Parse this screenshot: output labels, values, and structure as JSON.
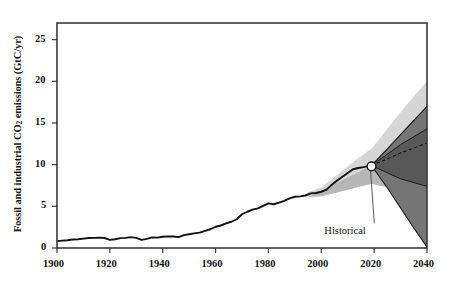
{
  "chart_data": {
    "type": "line",
    "title": "",
    "xlabel": "",
    "ylabel": "Fossil and industrial CO2 emissions (GtC/yr)",
    "ylabel_parts": {
      "pre": "Fossil and industrial CO",
      "sub": "2",
      "post": " emissions (GtC/yr)"
    },
    "xlim": [
      1900,
      2040
    ],
    "ylim": [
      0,
      27
    ],
    "grid": false,
    "legend": false,
    "xticks": [
      1900,
      1920,
      1940,
      1960,
      1980,
      2000,
      2020,
      2040
    ],
    "xtick_labels": [
      "1900",
      "1920",
      "1940",
      "1960",
      "1980",
      "2000",
      "2020",
      "2040"
    ],
    "yticks": [
      0,
      5,
      10,
      15,
      20,
      25
    ],
    "ytick_labels": [
      "0",
      "5",
      "10",
      "15",
      "20",
      "25"
    ],
    "annotations": [
      {
        "text": "Historical",
        "x": 2012.5,
        "y": 2.0,
        "points_to_x": 2019,
        "points_to_y": 9.8
      }
    ],
    "marker_point": {
      "x": 2019,
      "y": 9.8,
      "style": "white-filled-circle",
      "label": "Historical"
    },
    "colors": {
      "line": "#111111",
      "axis": "#3a3a3a",
      "band_light": "#c9c9c9",
      "band_mid": "#9a9a9a",
      "band_dark": "#6e6e6e",
      "band_darkest": "#4f4f4f",
      "marker_fill": "#ffffff",
      "marker_edge": "#111111",
      "text": "#141414"
    },
    "series": [
      {
        "name": "Historical emissions",
        "type": "line",
        "x": [
          1900,
          1902,
          1904,
          1906,
          1908,
          1910,
          1912,
          1914,
          1916,
          1918,
          1920,
          1922,
          1924,
          1926,
          1928,
          1930,
          1932,
          1934,
          1936,
          1938,
          1940,
          1942,
          1944,
          1946,
          1948,
          1950,
          1952,
          1954,
          1956,
          1958,
          1960,
          1962,
          1964,
          1966,
          1968,
          1970,
          1972,
          1974,
          1976,
          1978,
          1980,
          1982,
          1984,
          1986,
          1988,
          1990,
          1992,
          1994,
          1996,
          1998,
          2000,
          2002,
          2004,
          2006,
          2008,
          2010,
          2012,
          2014,
          2016,
          2018,
          2019
        ],
        "y": [
          0.82,
          0.88,
          0.93,
          1.02,
          1.05,
          1.12,
          1.2,
          1.22,
          1.25,
          1.2,
          0.98,
          1.05,
          1.18,
          1.22,
          1.3,
          1.22,
          0.98,
          1.1,
          1.28,
          1.25,
          1.35,
          1.4,
          1.38,
          1.3,
          1.55,
          1.65,
          1.75,
          1.85,
          2.05,
          2.25,
          2.55,
          2.7,
          2.95,
          3.15,
          3.45,
          4.05,
          4.35,
          4.6,
          4.75,
          5.05,
          5.35,
          5.25,
          5.45,
          5.65,
          5.95,
          6.15,
          6.2,
          6.3,
          6.55,
          6.6,
          6.75,
          7.0,
          7.6,
          8.1,
          8.55,
          9.0,
          9.45,
          9.6,
          9.7,
          9.85,
          9.9
        ]
      },
      {
        "name": "Projection median",
        "type": "dashed-line",
        "x": [
          2019,
          2025,
          2030,
          2035,
          2040
        ],
        "y": [
          9.9,
          10.7,
          11.4,
          12.0,
          12.6
        ]
      },
      {
        "name": "Projection upper bound",
        "type": "boundary-line",
        "x": [
          2019,
          2025,
          2030,
          2035,
          2040
        ],
        "y": [
          9.9,
          11.9,
          13.6,
          15.3,
          17.0
        ]
      },
      {
        "name": "Projection lower bound",
        "type": "boundary-line",
        "x": [
          2019,
          2025,
          2030,
          2035,
          2040
        ],
        "y": [
          9.9,
          7.2,
          4.8,
          2.4,
          0.1
        ]
      },
      {
        "name": "Projection inner upper",
        "type": "boundary-line",
        "x": [
          2019,
          2030,
          2040
        ],
        "y": [
          9.9,
          12.4,
          14.3
        ]
      },
      {
        "name": "Projection inner lower",
        "type": "boundary-line",
        "x": [
          2019,
          2030,
          2040
        ],
        "y": [
          9.9,
          8.3,
          7.4
        ]
      },
      {
        "name": "Historical uncertainty upper",
        "type": "band-edge",
        "x": [
          1995,
          2000,
          2005,
          2010,
          2015,
          2019,
          2025,
          2030,
          2035,
          2040
        ],
        "y": [
          6.7,
          7.3,
          8.5,
          9.8,
          11.0,
          11.9,
          14.3,
          16.3,
          18.2,
          20.0
        ]
      },
      {
        "name": "Historical uncertainty lower",
        "type": "band-edge",
        "x": [
          1995,
          2000,
          2005,
          2010,
          2015,
          2019,
          2025,
          2030,
          2035,
          2040
        ],
        "y": [
          6.1,
          6.2,
          6.6,
          7.0,
          7.4,
          7.7,
          7.3,
          7.0,
          6.8,
          6.6
        ]
      }
    ]
  },
  "axis": {
    "ylabel_pre": "Fossil and industrial CO",
    "ylabel_sub": "2",
    "ylabel_post": " emissions (GtC/yr)"
  }
}
